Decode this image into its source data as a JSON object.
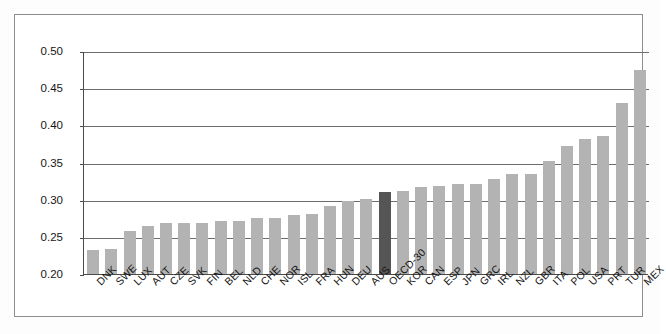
{
  "chart": {
    "type": "bar",
    "title": "",
    "xlabel": "",
    "ylabel": "",
    "highlight_category": "OECD-30",
    "colors": {
      "bar": "#b3b3b3",
      "highlight_bar": "#555555",
      "gridline": "#6d6d6d",
      "axis": "#4a4a4a",
      "frame": "#8d8d8d",
      "background": "#ffffff",
      "text": "#161616"
    }
  },
  "chart_data": {
    "type": "bar",
    "title": "",
    "xlabel": "",
    "ylabel": "",
    "ylim": [
      0.2,
      0.5
    ],
    "yticks": [
      "0.20",
      "0.25",
      "0.30",
      "0.35",
      "0.40",
      "0.45",
      "0.50"
    ],
    "ytick_values": [
      0.2,
      0.25,
      0.3,
      0.35,
      0.4,
      0.45,
      0.5
    ],
    "grid": true,
    "legend": "none",
    "highlight_category": "OECD-30",
    "categories": [
      "DNK",
      "SWE",
      "LUX",
      "AUT",
      "CZE",
      "SVK",
      "FIN",
      "BEL",
      "NLD",
      "CHE",
      "NOR",
      "ISL",
      "FRA",
      "HUN",
      "DEU",
      "AUS",
      "OECD-30",
      "KOR",
      "CAN",
      "ESP",
      "JPN",
      "GRC",
      "IRL",
      "NZL",
      "GBR",
      "ITA",
      "POL",
      "USA",
      "PRT",
      "TUR",
      "MEX"
    ],
    "values": [
      0.232,
      0.234,
      0.258,
      0.265,
      0.268,
      0.268,
      0.269,
      0.271,
      0.271,
      0.276,
      0.276,
      0.28,
      0.281,
      0.291,
      0.298,
      0.301,
      0.311,
      0.312,
      0.317,
      0.319,
      0.321,
      0.321,
      0.328,
      0.335,
      0.335,
      0.352,
      0.372,
      0.381,
      0.385,
      0.43,
      0.474
    ]
  },
  "ylabels": [
    "0.50",
    "0.45",
    "0.40",
    "0.35",
    "0.30",
    "0.25",
    "0.20"
  ]
}
